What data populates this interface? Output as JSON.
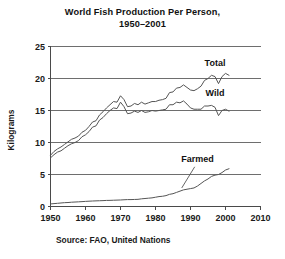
{
  "figure": {
    "title": "World Fish Production Per Person,\n1950–2001",
    "source_note": "Source: FAO, United Nations",
    "background_color": "#ffffff",
    "line_color": "#555555",
    "grid_color": "#6e6e6e"
  },
  "chart_data": {
    "type": "line",
    "title": "World Fish Production Per Person, 1950–2001",
    "subtitle": "",
    "xlabel": "",
    "ylabel": "Kilograms",
    "xlim": [
      1950,
      2010
    ],
    "ylim": [
      0,
      25
    ],
    "xticks": [
      1950,
      1960,
      1970,
      1980,
      1990,
      2000,
      2010
    ],
    "yticks": [
      0,
      5,
      10,
      15,
      20,
      25
    ],
    "xtick_labels": [
      "1950",
      "1960",
      "1970",
      "1980",
      "1990",
      "2000",
      "2010"
    ],
    "ytick_labels": [
      "0",
      "5",
      "10",
      "15",
      "20",
      "25"
    ],
    "grid": "horizontal",
    "legend_position": "inline-annotations",
    "annotations": [
      {
        "text": "Total",
        "x": 1997,
        "y": 22.0
      },
      {
        "text": "Wild",
        "x": 1997,
        "y": 17.3
      },
      {
        "text": "Farmed",
        "x": 1992,
        "y": 7.0
      }
    ],
    "x": [
      1950,
      1951,
      1952,
      1953,
      1954,
      1955,
      1956,
      1957,
      1958,
      1959,
      1960,
      1961,
      1962,
      1963,
      1964,
      1965,
      1966,
      1967,
      1968,
      1969,
      1970,
      1971,
      1972,
      1973,
      1974,
      1975,
      1976,
      1977,
      1978,
      1979,
      1980,
      1981,
      1982,
      1983,
      1984,
      1985,
      1986,
      1987,
      1988,
      1989,
      1990,
      1991,
      1992,
      1993,
      1994,
      1995,
      1996,
      1997,
      1998,
      1999,
      2000,
      2001
    ],
    "series": [
      {
        "name": "Total",
        "label": "Total",
        "values": [
          8.0,
          8.6,
          9.0,
          9.3,
          9.7,
          10.1,
          10.5,
          10.7,
          11.0,
          11.6,
          11.9,
          12.5,
          13.2,
          13.4,
          14.3,
          14.8,
          15.4,
          15.9,
          16.4,
          16.3,
          17.3,
          16.7,
          15.6,
          15.7,
          16.1,
          15.9,
          16.3,
          16.0,
          16.2,
          16.4,
          16.4,
          16.6,
          16.7,
          16.9,
          17.8,
          17.9,
          18.5,
          18.6,
          19.0,
          18.6,
          18.2,
          18.1,
          18.4,
          18.8,
          19.7,
          20.0,
          20.5,
          20.3,
          19.2,
          20.3,
          20.8,
          20.5
        ]
      },
      {
        "name": "Wild",
        "label": "Wild",
        "values": [
          7.6,
          8.1,
          8.5,
          8.7,
          9.1,
          9.5,
          9.8,
          10.0,
          10.3,
          10.9,
          11.2,
          11.7,
          12.4,
          12.6,
          13.5,
          13.9,
          14.5,
          15.0,
          15.4,
          15.3,
          16.3,
          15.6,
          14.5,
          14.6,
          14.9,
          14.7,
          15.0,
          14.7,
          14.8,
          15.0,
          14.9,
          15.0,
          15.1,
          15.2,
          15.9,
          15.9,
          16.3,
          16.2,
          16.5,
          16.0,
          15.4,
          15.2,
          15.2,
          15.2,
          15.7,
          15.7,
          15.8,
          15.5,
          14.2,
          15.0,
          15.2,
          14.9
        ]
      },
      {
        "name": "Farmed",
        "label": "Farmed",
        "values": [
          0.4,
          0.45,
          0.5,
          0.55,
          0.6,
          0.62,
          0.67,
          0.7,
          0.73,
          0.76,
          0.8,
          0.83,
          0.86,
          0.88,
          0.9,
          0.92,
          0.95,
          0.96,
          0.98,
          1.0,
          1.02,
          1.05,
          1.08,
          1.08,
          1.1,
          1.12,
          1.2,
          1.25,
          1.3,
          1.35,
          1.45,
          1.55,
          1.6,
          1.7,
          1.9,
          2.0,
          2.2,
          2.4,
          2.6,
          2.7,
          2.8,
          2.9,
          3.2,
          3.6,
          4.0,
          4.3,
          4.7,
          4.9,
          5.0,
          5.3,
          5.7,
          5.9
        ]
      }
    ]
  }
}
